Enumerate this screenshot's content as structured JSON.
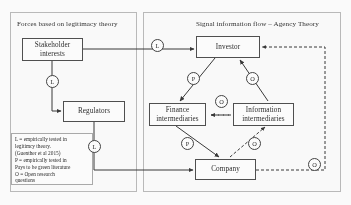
{
  "panels": {
    "left": {
      "title": "Forces based on legitimacy theory"
    },
    "right": {
      "title": "Signal information flow – Agency Theory"
    }
  },
  "nodes": {
    "stakeholder": "Stakeholder interests",
    "regulators": "Regulators",
    "investor": "Investor",
    "finance": "Finance intermediaries",
    "information": "Information intermediaries",
    "company": "Company"
  },
  "legend": {
    "line1": "L = empirically tested in",
    "line2": "legitimcy theory.",
    "line3": "(Guenther et al 2015)",
    "line4": "P = empirically tested in",
    "line5": "Pays to be green literature",
    "line6": "O = Open research",
    "line7": "questions"
  },
  "badges": {
    "stakeholder_to_investor": "L",
    "stakeholder_to_regulators": "L",
    "regulators_to_company": "L",
    "investor_to_finance": "P",
    "information_to_investor": "O",
    "finance_information": "O",
    "finance_to_company": "P",
    "company_to_information": "O",
    "company_to_investor": "O"
  },
  "colors": {
    "panel_border": "#b9b9b9",
    "node_border": "#4a4a4a",
    "line": "#333333",
    "text": "#1e1e1e",
    "background": "#fefefe"
  }
}
